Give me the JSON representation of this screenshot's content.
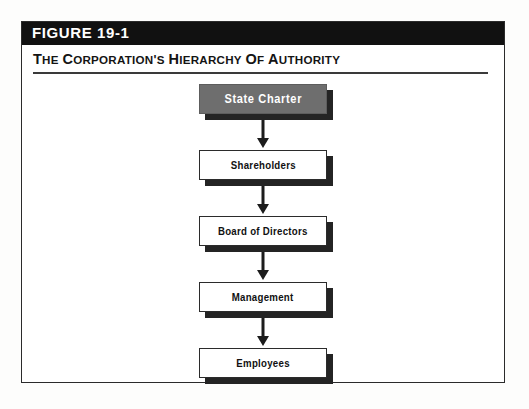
{
  "figure": {
    "number_label": "FIGURE 19-1",
    "subtitle": "THE CORPORATION'S HIERARCHY OF AUTHORITY"
  },
  "colors": {
    "header_bar": "#111111",
    "header_text": "#ffffff",
    "frame_border": "#2b2b2b",
    "node_fill_highlight": "#6e6e6e",
    "node_fill_default": "#ffffff",
    "node_border": "#2b2b2b",
    "shadow": "#242424",
    "connector": "#1c1c1c",
    "rule": "#3a3a3a"
  },
  "chart_data": {
    "type": "diagram",
    "diagram_kind": "vertical-flowchart",
    "title": "THE CORPORATION'S HIERARCHY OF AUTHORITY",
    "orientation": "top-to-bottom",
    "nodes": [
      {
        "id": "state-charter",
        "label": "State Charter",
        "level": 1,
        "style": "filled-gray",
        "text_color": "#ffffff"
      },
      {
        "id": "shareholders",
        "label": "Shareholders",
        "level": 2,
        "style": "outlined",
        "text_color": "#111111"
      },
      {
        "id": "board-of-directors",
        "label": "Board of Directors",
        "level": 3,
        "style": "outlined",
        "text_color": "#111111"
      },
      {
        "id": "management",
        "label": "Management",
        "level": 4,
        "style": "outlined",
        "text_color": "#111111"
      },
      {
        "id": "employees",
        "label": "Employees",
        "level": 5,
        "style": "outlined",
        "text_color": "#111111"
      }
    ],
    "edges": [
      {
        "from": "state-charter",
        "to": "shareholders",
        "arrow": "down"
      },
      {
        "from": "shareholders",
        "to": "board-of-directors",
        "arrow": "down"
      },
      {
        "from": "board-of-directors",
        "to": "management",
        "arrow": "down"
      },
      {
        "from": "management",
        "to": "employees",
        "arrow": "down"
      }
    ],
    "legend": [],
    "annotations": []
  }
}
